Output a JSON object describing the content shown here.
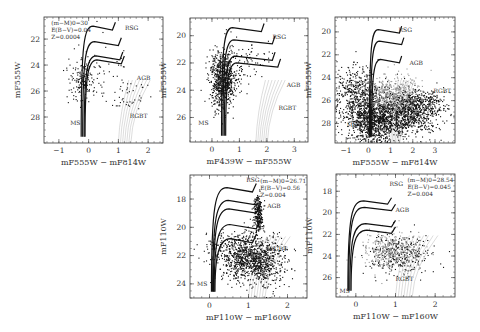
{
  "chart_data": [
    {
      "type": "scatter",
      "title": "",
      "xlabel": "m_F555W − m_F814W",
      "ylabel": "m_F555W",
      "xlim": [
        -1.5,
        2.5
      ],
      "ylim": [
        30,
        20.3
      ],
      "xticks": [
        "-1",
        "0",
        "1",
        "2"
      ],
      "yticks": [
        "22",
        "24",
        "26",
        "28"
      ],
      "annotation": [
        "(m−M)0=30",
        "E(B−V)=0.04",
        "Z=0.0004"
      ],
      "labels": [
        "RSG",
        "AGB",
        "MS",
        "RGBT"
      ],
      "frame": {
        "x": 44,
        "y": 17,
        "w": 119,
        "h": 126
      }
    },
    {
      "type": "scatter",
      "title": "",
      "xlabel": "m_F439W − m_F555W",
      "ylabel": "m_F555W",
      "xlim": [
        -0.8,
        3.5
      ],
      "ylim": [
        27.8,
        18.7
      ],
      "xticks": [
        "0",
        "1",
        "2",
        "3"
      ],
      "yticks": [
        "20",
        "22",
        "24",
        "26"
      ],
      "annotation": [],
      "labels": [
        "RSG",
        "AGB",
        "MS",
        "RGBT"
      ],
      "frame": {
        "x": 190,
        "y": 18,
        "w": 118,
        "h": 124
      }
    },
    {
      "type": "scatter",
      "title": "",
      "xlabel": "m_F555W − m_F814W",
      "ylabel": "m_F555W",
      "xlim": [
        -1.5,
        3.9
      ],
      "ylim": [
        29.7,
        18.7
      ],
      "xticks": [
        "-1",
        "0",
        "1",
        "2",
        "3"
      ],
      "yticks": [
        "20",
        "22",
        "24",
        "26",
        "28"
      ],
      "annotation": [],
      "labels": [
        "RSG",
        "AGB",
        "MS",
        "RGBT"
      ],
      "frame": {
        "x": 335,
        "y": 17,
        "w": 120,
        "h": 126
      }
    },
    {
      "type": "scatter",
      "title": "",
      "xlabel": "m_F110W − m_F160W",
      "ylabel": "m_F110W",
      "xlim": [
        -0.5,
        2.5
      ],
      "ylim": [
        25,
        16.3
      ],
      "xticks": [
        "0",
        "1",
        "2"
      ],
      "yticks": [
        "18",
        "20",
        "22",
        "24"
      ],
      "annotation": [
        "(m−M)0=26.71",
        "E(B−V)=0.56",
        "Z=0.004"
      ],
      "labels": [
        "RSG",
        "AGB",
        "MS",
        "RGBT"
      ],
      "frame": {
        "x": 190,
        "y": 175,
        "w": 117,
        "h": 123
      }
    },
    {
      "type": "scatter",
      "title": "",
      "xlabel": "m_F110W − m_F160W",
      "ylabel": "m_F110W",
      "xlim": [
        -0.5,
        2.5
      ],
      "ylim": [
        27.8,
        16.4
      ],
      "xticks": [
        "0",
        "1",
        "2"
      ],
      "yticks": [
        "18",
        "20",
        "22",
        "24",
        "26"
      ],
      "annotation": [
        "(m−M)0=28.54",
        "E(B−V)=0.045",
        "Z=0.004"
      ],
      "labels": [
        "RSG",
        "AGB",
        "MS",
        "RGBT"
      ],
      "frame": {
        "x": 336,
        "y": 174,
        "w": 119,
        "h": 123
      }
    }
  ]
}
